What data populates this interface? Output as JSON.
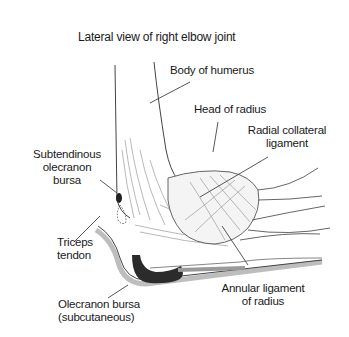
{
  "diagram": {
    "title": "Lateral view of right elbow joint",
    "labels": [
      {
        "id": "body-of-humerus",
        "lines": [
          "Body of humerus"
        ]
      },
      {
        "id": "head-of-radius",
        "lines": [
          "Head of radius"
        ]
      },
      {
        "id": "radial-collateral-ligament",
        "lines": [
          "Radial collateral",
          "ligament"
        ]
      },
      {
        "id": "subtendinous-olecranon-bursa",
        "lines": [
          "Subtendinous",
          "olecranon",
          "bursa"
        ]
      },
      {
        "id": "triceps-tendon",
        "lines": [
          "Triceps",
          "tendon"
        ]
      },
      {
        "id": "olecranon-bursa",
        "lines": [
          "Olecranon bursa",
          "(subcutaneous)"
        ]
      },
      {
        "id": "annular-ligament-of-radius",
        "lines": [
          "Annular ligament",
          "of radius"
        ]
      }
    ],
    "colors": {
      "ink": "#1a1a1a",
      "line": "#333333",
      "sketch": "#8a8a8a",
      "bursa": "#2b2b2b",
      "skin_shadow": "#9a9a9a"
    }
  }
}
